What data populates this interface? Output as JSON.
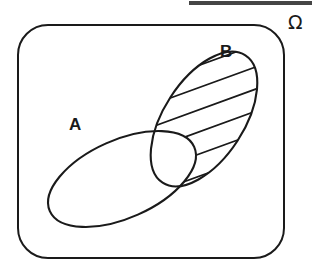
{
  "figure": {
    "background_color": "#ffffff",
    "ink_color": "#1a1a1a",
    "width": 312,
    "height": 269
  },
  "universe": {
    "label": "Ω",
    "label_name": "omega",
    "label_x": 288,
    "label_y": 29,
    "frame": {
      "x": 18,
      "y": 25,
      "width": 266,
      "height": 233,
      "corner_radius": 30
    }
  },
  "sets": [
    {
      "id": "A",
      "label": "A",
      "label_x": 69,
      "label_y": 130,
      "shaded": false,
      "ellipse": {
        "cx": 122,
        "cy": 179,
        "rx": 79,
        "ry": 39,
        "rotation_deg": -24
      }
    },
    {
      "id": "B",
      "label": "B",
      "label_x": 220,
      "label_y": 57,
      "shaded": true,
      "hatch_angle_deg": -20,
      "hatch_line_count": 6,
      "ellipse": {
        "cx": 204,
        "cy": 119,
        "rx": 76,
        "ry": 40,
        "rotation_deg": -57
      }
    }
  ],
  "shading": {
    "region_description": "B \\ A",
    "pattern": "diagonal-hatch",
    "line_color": "#1a1a1a",
    "excluded_region": "A ∩ B"
  },
  "artifacts": {
    "top_bar": {
      "x": 189,
      "y": 1,
      "width": 123,
      "height": 3.5,
      "color": "#2b2b2b"
    },
    "speck": {
      "x": 283,
      "y": 214,
      "color": "#9a9a9a"
    }
  }
}
